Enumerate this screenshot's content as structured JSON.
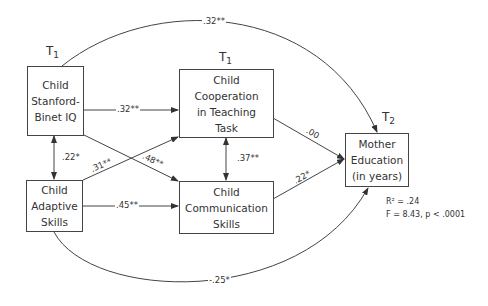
{
  "diagram": {
    "type": "path-model",
    "nodes": {
      "iq": {
        "time_label": "T",
        "time_sub": "1",
        "lines": [
          "Child",
          "Stanford-",
          "Binet IQ"
        ]
      },
      "coop": {
        "time_label": "T",
        "time_sub": "1",
        "lines": [
          "Child",
          "Cooperation",
          "in Teaching",
          "Task"
        ]
      },
      "adaptive": {
        "lines": [
          "Child",
          "Adaptive",
          "Skills"
        ]
      },
      "comm": {
        "lines": [
          "Child",
          "Communication",
          "Skills"
        ]
      },
      "mother": {
        "time_label": "T",
        "time_sub": "2",
        "lines": [
          "Mother",
          "Education",
          "(in years)"
        ]
      }
    },
    "edges": {
      "iq_mother": ".32**",
      "iq_coop": ".32**",
      "iq_adaptive": ".22*",
      "adaptive_coop": ".31**",
      "iq_comm": ".48**",
      "coop_comm": ".37**",
      "coop_mother": ".00",
      "comm_mother": ".22*",
      "adaptive_comm": ".45**",
      "adaptive_mother": "-.25*"
    },
    "stats": {
      "r2": "R² = .24",
      "f": "F = 8.43, p < .0001"
    }
  }
}
